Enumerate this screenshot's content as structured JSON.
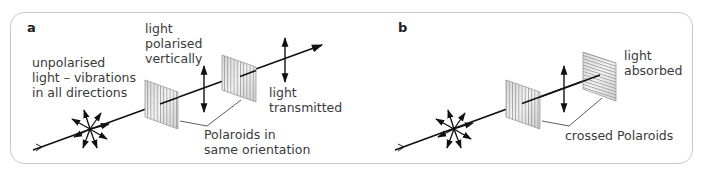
{
  "figure": {
    "panels": [
      {
        "id": "a",
        "letter": "a",
        "labels": {
          "unpolarised": "unpolarised\nlight – vibrations\nin all directions",
          "polarised": "light\npolarised\nvertically",
          "transmitted": "light\ntransmitted",
          "polaroids": "Polaroids in\nsame orientation"
        }
      },
      {
        "id": "b",
        "letter": "b",
        "labels": {
          "absorbed": "light\nabsorbed",
          "polaroids": "crossed Polaroids"
        }
      }
    ],
    "colors": {
      "line": "#111111",
      "frame": "#c8c8c8",
      "filter_stripe": "#9a9a9a",
      "text": "#3a3a3a"
    }
  }
}
